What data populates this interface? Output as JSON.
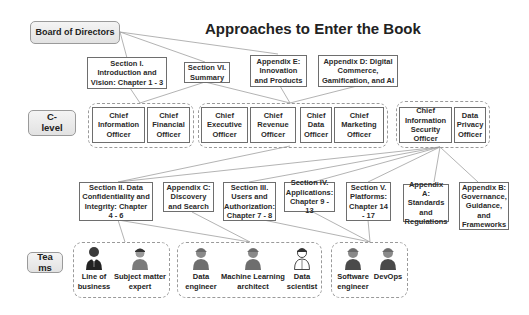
{
  "title": "Approaches to Enter the Book",
  "levels": {
    "board": "Board of Directors",
    "clevel": "C-\nlevel",
    "teams": "Tea\nms"
  },
  "top_sections": [
    {
      "id": "sec1",
      "label": "Section I. Introduction and Vision: Chapter 1 - 3"
    },
    {
      "id": "sec6",
      "label": "Section VI. Summary"
    },
    {
      "id": "appE",
      "label": "Appendix E: Innovation and Products"
    },
    {
      "id": "appD",
      "label": "Appendix D: Digital Commerce, Gamification, and AI"
    }
  ],
  "clevel_groups": [
    {
      "members": [
        "Chief Information Officer",
        "Chief Financial Officer"
      ]
    },
    {
      "members": [
        "Chief Executive Officer",
        "Chief Revenue Officer",
        "Chief Data Officer",
        "Chief Marketing Officer"
      ]
    },
    {
      "members": [
        "Chief Information Security Officer",
        "Data Privacy Officer"
      ]
    }
  ],
  "bottom_sections": [
    {
      "id": "sec2",
      "label": "Section II. Data Confidentiality and Integrity: Chapter 4 - 6"
    },
    {
      "id": "appC",
      "label": "Appendix C: Discovery and Search"
    },
    {
      "id": "sec3",
      "label": "Section III. Users and Authorization: Chapter 7 - 8"
    },
    {
      "id": "sec4",
      "label": "Section IV. Applications: Chapter 9 - 13"
    },
    {
      "id": "sec5",
      "label": "Section V. Platforms: Chapter 14 - 17"
    },
    {
      "id": "appA",
      "label": "Appendix A: Standards and Regulations"
    },
    {
      "id": "appB",
      "label": "Appendix B: Governance, Guidance, and Frameworks"
    }
  ],
  "team_groups": [
    {
      "members": [
        {
          "label": "Line of business",
          "icon": "businessman-icon"
        },
        {
          "label": "Subject matter expert",
          "icon": "expert-person-icon"
        }
      ]
    },
    {
      "members": [
        {
          "label": "Data engineer",
          "icon": "engineer-helmet-icon"
        },
        {
          "label": "Machine Learning architect",
          "icon": "engineer-helmet-icon"
        },
        {
          "label": "Data scientist",
          "icon": "scientist-outline-icon"
        }
      ]
    },
    {
      "members": [
        {
          "label": "Software engineer",
          "icon": "engineer-helmet-icon"
        },
        {
          "label": "DevOps",
          "icon": "engineer-helmet-icon"
        }
      ]
    }
  ],
  "colors": {
    "line": "#9a9a9a",
    "box_border": "#6e6e6e",
    "label_fill": "#e8e8e8",
    "person_dark": "#3a3a3a",
    "person_gray": "#7b7b7b"
  }
}
